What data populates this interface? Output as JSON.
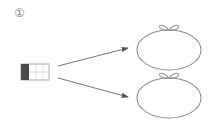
{
  "step_label": "①",
  "colors": {
    "stroke": "#8c8c8c",
    "grid_dark": "#4a4a4a",
    "arrow": "#555555"
  },
  "diagram": {
    "source": "grid-block",
    "targets": [
      "bag-top",
      "bag-bottom"
    ]
  }
}
